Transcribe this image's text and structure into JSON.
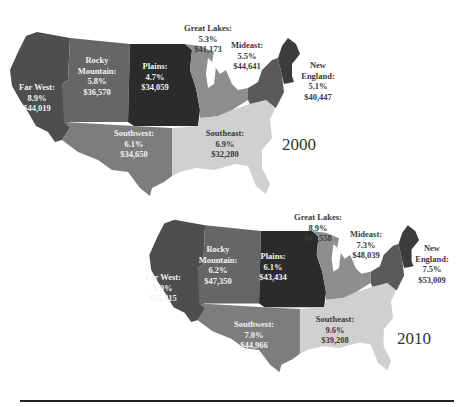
{
  "colors": {
    "far_west": "#4e4e4e",
    "rocky_mountain": "#666666",
    "plains": "#2b2b2b",
    "southwest": "#7d7d7d",
    "southeast": "#d0d0d0",
    "great_lakes": "#8e8e8e",
    "mideast": "#5a5a5a",
    "new_england": "#3c3c3c",
    "rule": "#222222"
  },
  "maps": [
    {
      "year": "2000",
      "regions": {
        "far_west": {
          "name": "Far West:",
          "pct": "8.9%",
          "income": "$44,019"
        },
        "rocky_mountain": {
          "name1": "Rocky",
          "name2": "Mountain:",
          "pct": "5.8%",
          "income": "$36,570"
        },
        "plains": {
          "name": "Plains:",
          "pct": "4.7%",
          "income": "$34,059"
        },
        "southwest": {
          "name": "Southwest:",
          "pct": "6.1%",
          "income": "$34,650"
        },
        "southeast": {
          "name": "Southeast:",
          "pct": "6.9%",
          "income": "$32,280"
        },
        "great_lakes": {
          "name": "Great Lakes:",
          "pct": "5.3%",
          "income": "$41,173"
        },
        "mideast": {
          "name": "Mideast:",
          "pct": "5.5%",
          "income": "$44,641"
        },
        "new_england": {
          "name1": "New",
          "name2": "England:",
          "pct": "5.1%",
          "income": "$40,447"
        }
      }
    },
    {
      "year": "2010",
      "regions": {
        "far_west": {
          "name": "Far West:",
          "pct": "8.9%",
          "income": "$55,415"
        },
        "rocky_mountain": {
          "name1": "Rocky",
          "name2": "Mountain:",
          "pct": "6.2%",
          "income": "$47,350"
        },
        "plains": {
          "name": "Plains:",
          "pct": "6.1%",
          "income": "$43,434"
        },
        "southwest": {
          "name": "Southwest:",
          "pct": "7.0%",
          "income": "$44,966"
        },
        "southeast": {
          "name": "Southeast:",
          "pct": "9.6%",
          "income": "$39,208"
        },
        "great_lakes": {
          "name": "Great Lakes:",
          "pct": "8.9%",
          "income": "$47,558"
        },
        "mideast": {
          "name": "Mideast:",
          "pct": "7.3%",
          "income": "$48,039"
        },
        "new_england": {
          "name1": "New",
          "name2": "England:",
          "pct": "7.5%",
          "income": "$53,009"
        }
      }
    }
  ]
}
